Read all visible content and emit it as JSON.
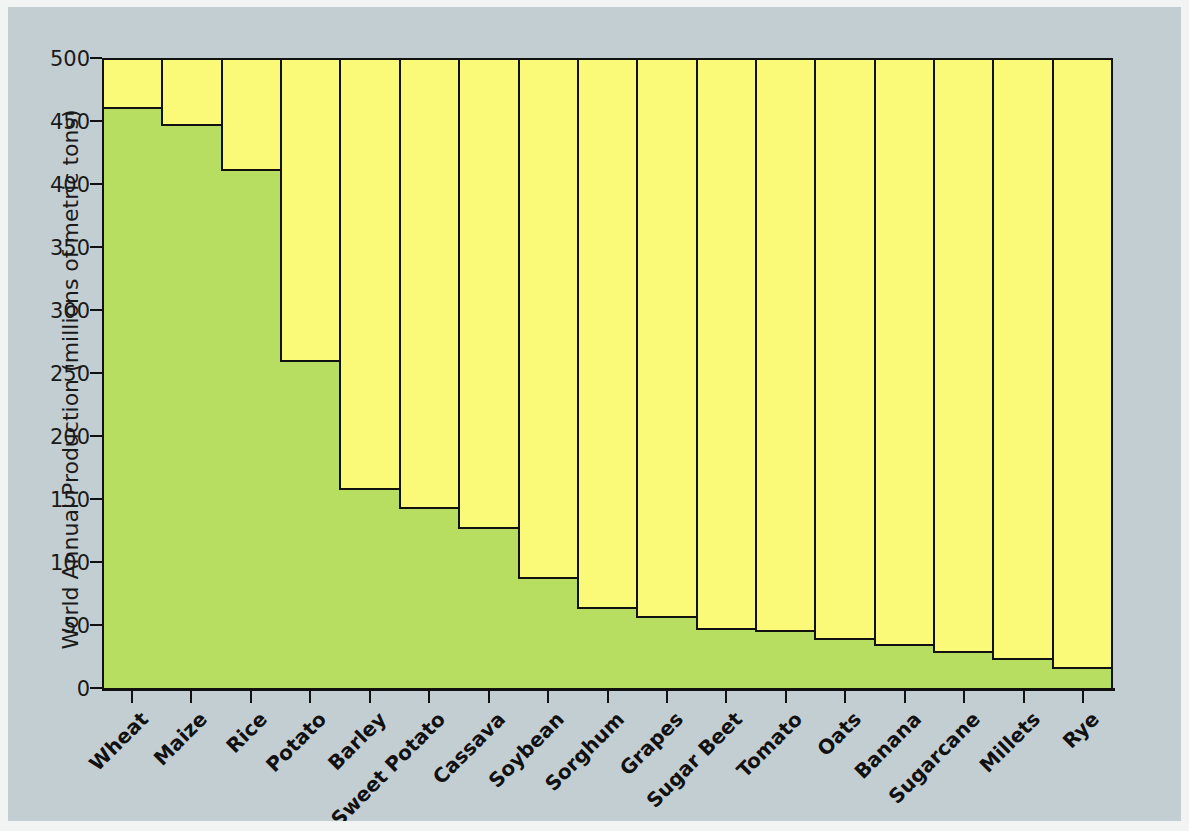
{
  "chart_data": {
    "type": "bar",
    "title": "",
    "xlabel": "",
    "ylabel": "World Annual Production (millions of metric tons)",
    "ylim": [
      0,
      500
    ],
    "ytick_labels": [
      "0",
      "50",
      "100",
      "150",
      "200",
      "250",
      "300",
      "350",
      "400",
      "450",
      "500"
    ],
    "ytick_values": [
      0,
      50,
      100,
      150,
      200,
      250,
      300,
      350,
      400,
      450,
      500
    ],
    "grid": false,
    "legend": "none",
    "bar_color": "#b7dd61",
    "panel_color": "#fafa78",
    "background_color": "#c3ced3",
    "edge_color": "#111111",
    "categories": [
      "Wheat",
      "Maize",
      "Rice",
      "Potato",
      "Barley",
      "Sweet Potato",
      "Cassava",
      "Soybean",
      "Sorghum",
      "Grapes",
      "Sugar Beet",
      "Tomato",
      "Oats",
      "Banana",
      "Sugarcane",
      "Millets",
      "Rye"
    ],
    "values": [
      461,
      448,
      412,
      260,
      159,
      144,
      128,
      88,
      64,
      57,
      48,
      46,
      40,
      35,
      29,
      24,
      17
    ]
  }
}
